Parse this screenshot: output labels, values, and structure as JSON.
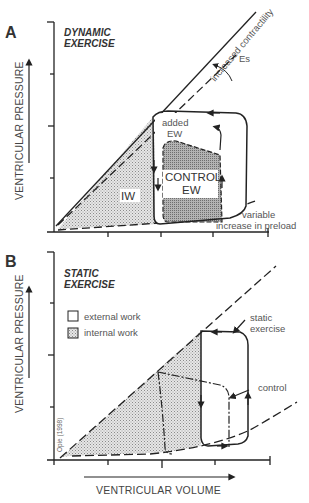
{
  "figure": {
    "credit": "Opie (1998)",
    "x_axis_label": "VENTRICULAR VOLUME",
    "colors": {
      "line": "#222222",
      "stipple_light": "#d9d9d9",
      "stipple_dark": "#9a9a9a",
      "background": "#ffffff"
    }
  },
  "panel_a": {
    "letter": "A",
    "title_line1": "DYNAMIC",
    "title_line2": "EXERCISE",
    "y_axis_label": "VENTRICULAR PRESSURE",
    "labels": {
      "increased_contractility": "increased contractility",
      "es": "Es",
      "added_ew_line1": "added",
      "added_ew_line2": "EW",
      "control_ew_line1": "CONTROL",
      "control_ew_line2": "EW",
      "iw": "IW",
      "preload_line1": "variable",
      "preload_line2": "increase in preload"
    }
  },
  "panel_b": {
    "letter": "B",
    "title_line1": "STATIC",
    "title_line2": "EXERCISE",
    "y_axis_label": "VENTRICULAR PRESSURE",
    "legend": [
      {
        "label": "external work",
        "swatch": "white"
      },
      {
        "label": "internal work",
        "swatch": "stippled"
      }
    ],
    "labels": {
      "static_line1": "static",
      "static_line2": "exercise",
      "control": "control"
    }
  }
}
